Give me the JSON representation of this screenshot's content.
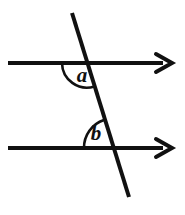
{
  "figure": {
    "background_color": "#ffffff",
    "stroke_color": "#111111",
    "width": 185,
    "height": 215
  },
  "labels": {
    "angle_a": "a",
    "angle_b": "b"
  },
  "geometry": {
    "line_width": 4,
    "arc_width": 2.6,
    "label_font_size": 21,
    "top_line": {
      "name": "upper-parallel-line",
      "x1": 8,
      "y1": 63,
      "x2": 163,
      "y2": 63,
      "arrow": "right"
    },
    "bottom_line": {
      "name": "lower-parallel-line",
      "x1": 8,
      "y1": 148,
      "x2": 163,
      "y2": 148,
      "arrow": "right"
    },
    "transversal": {
      "name": "transversal-line",
      "x1": 72,
      "y1": 13,
      "x2": 129,
      "y2": 197
    },
    "intersection_top": {
      "x": 87,
      "y": 63
    },
    "intersection_bottom": {
      "x": 113,
      "y": 148
    },
    "arrow_head_top": {
      "tip_x": 172,
      "y": 63,
      "half_height": 9,
      "back_x": 156
    },
    "arrow_head_bottom": {
      "tip_x": 172,
      "y": 148,
      "half_height": 9,
      "back_x": 156
    },
    "arc_a": {
      "name": "angle-a-arc",
      "center_x": 87,
      "center_y": 63,
      "radius": 25,
      "start_x": 62,
      "start_y": 63,
      "end_x": 94,
      "end_y": 86,
      "sweep": 1
    },
    "arc_b": {
      "name": "angle-b-arc",
      "center_x": 113,
      "center_y": 148,
      "radius": 29,
      "start_x": 84,
      "start_y": 148,
      "end_x": 104,
      "end_y": 120,
      "sweep": 0
    },
    "label_a_pos": {
      "x": 82,
      "y": 76
    },
    "label_b_pos": {
      "x": 96,
      "y": 135
    }
  }
}
